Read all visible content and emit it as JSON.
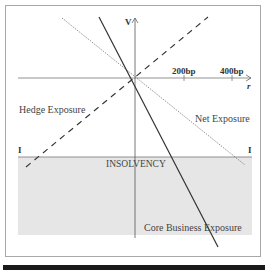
{
  "diagram": {
    "axes": {
      "y_label": "V",
      "x_label": "r",
      "x_ticks": [
        "200bp",
        "400bp"
      ]
    },
    "threshold": {
      "label": "INSOLVENCY",
      "left_marker": "I",
      "right_marker": "I"
    },
    "series": [
      {
        "name": "Hedge Exposure",
        "style": "dashed",
        "slope": "positive"
      },
      {
        "name": "Net Exposure",
        "style": "dotted",
        "slope": "negative-shallow"
      },
      {
        "name": "Core Business Exposure",
        "style": "solid",
        "slope": "negative-steep"
      }
    ],
    "colors": {
      "insolvency_region": "#e6e6e6",
      "lines": "#333333",
      "frame": "#a8a8a8"
    }
  }
}
